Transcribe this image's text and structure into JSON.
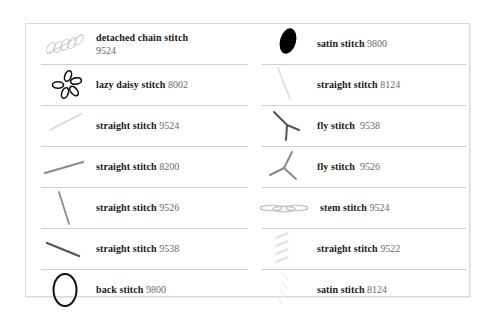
{
  "left_column": [
    {
      "name": "detached chain stitch",
      "code": "9524",
      "icon": "detached-chain-leaf-icon",
      "code_on_new_line": true,
      "color": "#c8c8c8"
    },
    {
      "name": "lazy daisy stitch",
      "code": "8002",
      "icon": "lazy-daisy-flower-icon",
      "color": "#111111"
    },
    {
      "name": "straight stitch",
      "code": "9524",
      "icon": "straight-line-icon",
      "color": "#d6d6d6"
    },
    {
      "name": "straight stitch",
      "code": "8200",
      "icon": "straight-line-icon",
      "color": "#8c8c8c"
    },
    {
      "name": "straight stitch",
      "code": "9526",
      "icon": "straight-line-icon",
      "color": "#8a8a8a"
    },
    {
      "name": "straight stitch",
      "code": "9538",
      "icon": "straight-line-icon",
      "color": "#555555"
    },
    {
      "name": "back stitch",
      "code": "9800",
      "icon": "oval-outline-icon",
      "color": "#111111"
    }
  ],
  "right_column": [
    {
      "name": "satin stitch",
      "code": "9800",
      "icon": "filled-oval-icon",
      "color": "#000000"
    },
    {
      "name": "straight stitch",
      "code": "8124",
      "icon": "straight-line-icon",
      "color": "#e2e2e2"
    },
    {
      "name": "fly stitch",
      "code": "9538",
      "icon": "fly-stitch-y-icon",
      "color": "#555555"
    },
    {
      "name": "fly stitch",
      "code": "9526",
      "icon": "fly-stitch-y-icon",
      "color": "#8a8a8a"
    },
    {
      "name": "stem stitch",
      "code": "9524",
      "icon": "stem-stitch-icon",
      "color": "#c8c8c8"
    },
    {
      "name": "straight stitch",
      "code": "9522",
      "icon": "parallel-lines-icon",
      "color": "#dedede"
    },
    {
      "name": "satin stitch",
      "code": "8124",
      "icon": "faint-satin-icon",
      "color": "#eeeeee"
    }
  ]
}
